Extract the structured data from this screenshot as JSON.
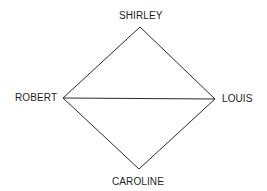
{
  "diagram": {
    "type": "graph",
    "nodes": [
      {
        "id": "shirley",
        "label": "SHIRLEY",
        "x": 140,
        "y": 27
      },
      {
        "id": "robert",
        "label": "ROBERT",
        "x": 63,
        "y": 98
      },
      {
        "id": "louis",
        "label": "LOUIS",
        "x": 215,
        "y": 99
      },
      {
        "id": "caroline",
        "label": "CAROLINE",
        "x": 139,
        "y": 169
      }
    ],
    "edges": [
      {
        "from": "shirley",
        "to": "robert"
      },
      {
        "from": "shirley",
        "to": "louis"
      },
      {
        "from": "robert",
        "to": "louis"
      },
      {
        "from": "robert",
        "to": "caroline"
      },
      {
        "from": "louis",
        "to": "caroline"
      }
    ],
    "colors": {
      "line": "#2a2a2a",
      "text": "#1e1e1e",
      "background": "#ffffff"
    }
  }
}
